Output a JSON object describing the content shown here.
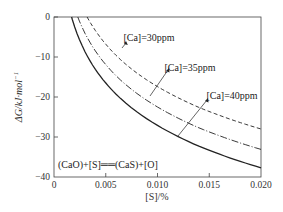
{
  "chart_data": {
    "type": "line",
    "title": "",
    "xlabel": "[S]/%",
    "ylabel": "ΔG/kJ·mol⁻¹",
    "xlim": [
      0,
      0.02
    ],
    "ylim": [
      -40,
      0
    ],
    "x_ticks": [
      "0",
      "0.005",
      "0.010",
      "0.015",
      "0.020"
    ],
    "y_ticks": [
      "0",
      "−10",
      "−20",
      "−30",
      "−40"
    ],
    "grid": false,
    "legend_position": "inline annotations",
    "series": [
      {
        "name": "[Ca]=30ppm",
        "style": "dashed",
        "x": [
          0.0032,
          0.004,
          0.005,
          0.006,
          0.008,
          0.01,
          0.012,
          0.014,
          0.016,
          0.018,
          0.02
        ],
        "y": [
          0,
          -3.4,
          -6.8,
          -9.6,
          -14.0,
          -17.4,
          -20.2,
          -22.6,
          -24.6,
          -26.4,
          -28.0
        ]
      },
      {
        "name": "[Ca]=35ppm",
        "style": "dash-dot",
        "x": [
          0.0023,
          0.003,
          0.004,
          0.005,
          0.006,
          0.008,
          0.01,
          0.012,
          0.014,
          0.016,
          0.018,
          0.02
        ],
        "y": [
          0,
          -4.1,
          -8.5,
          -11.9,
          -14.7,
          -19.1,
          -22.5,
          -25.3,
          -27.7,
          -29.7,
          -31.5,
          -33.1
        ]
      },
      {
        "name": "[Ca]=40ppm",
        "style": "solid",
        "x": [
          0.0017,
          0.002,
          0.003,
          0.004,
          0.005,
          0.006,
          0.008,
          0.01,
          0.012,
          0.014,
          0.016,
          0.018,
          0.02
        ],
        "y": [
          0,
          -2.5,
          -8.7,
          -13.1,
          -16.5,
          -19.3,
          -23.7,
          -27.1,
          -29.9,
          -32.3,
          -34.3,
          -36.1,
          -37.7
        ]
      }
    ],
    "annotations": [
      {
        "text": "[Ca]=30ppm",
        "target_series": "[Ca]=30ppm"
      },
      {
        "text": "[Ca]=35ppm",
        "target_series": "[Ca]=35ppm"
      },
      {
        "text": "[Ca]=40ppm",
        "target_series": "[Ca]=40ppm"
      },
      {
        "text": "(CaO)+[S]══(CaS)+[O]",
        "role": "reaction-equation"
      }
    ]
  },
  "labels": {
    "xlabel": "[S]/%",
    "ylabel": "ΔG/kJ·mol",
    "ylabel_sup": "−1",
    "x_ticks": [
      "0",
      "0.005",
      "0.010",
      "0.015",
      "0.020"
    ],
    "y_ticks": [
      "0",
      "−10",
      "−20",
      "−30",
      "−40"
    ],
    "ann_30": "[Ca]=30ppm",
    "ann_35": "[Ca]=35ppm",
    "ann_40": "[Ca]=40ppm",
    "reaction": "(CaO)+[S]══(CaS)+[O]"
  }
}
